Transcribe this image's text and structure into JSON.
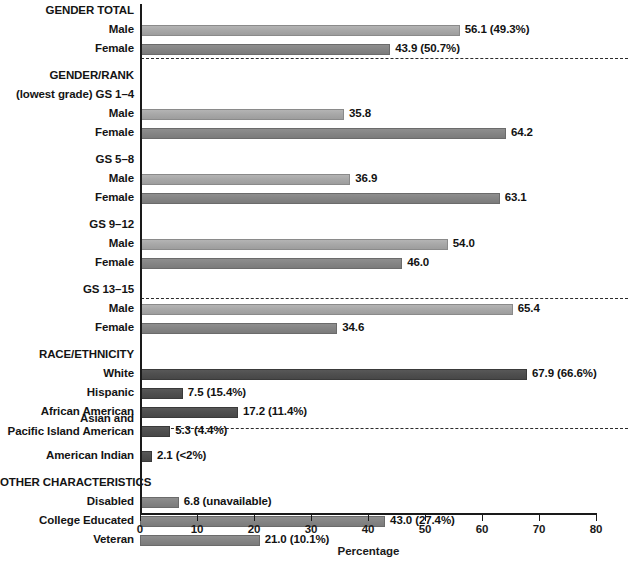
{
  "chart_data": {
    "type": "bar",
    "title": "",
    "xlabel": "Percentage",
    "ylabel": "",
    "xlim": [
      0,
      80
    ],
    "xticks": [
      0,
      10,
      20,
      30,
      40,
      50,
      60,
      70,
      80
    ],
    "grid": false,
    "legend": "none",
    "orientation": "horizontal",
    "sections": [
      {
        "heading": "GENDER TOTAL",
        "rows": [
          {
            "label": "Male",
            "value": 56.1,
            "value_label": "56.1 (49.3%)",
            "shade": "light"
          },
          {
            "label": "Female",
            "value": 43.9,
            "value_label": "43.9 (50.7%)",
            "shade": "mid"
          }
        ]
      },
      {
        "heading": "GENDER/RANK",
        "subheading": "(lowest grade) GS 1–4",
        "rows": [
          {
            "label": "Male",
            "value": 35.8,
            "value_label": "35.8",
            "shade": "light"
          },
          {
            "label": "Female",
            "value": 64.2,
            "value_label": "64.2",
            "shade": "mid"
          }
        ]
      },
      {
        "subheading": "GS 5–8",
        "rows": [
          {
            "label": "Male",
            "value": 36.9,
            "value_label": "36.9",
            "shade": "light"
          },
          {
            "label": "Female",
            "value": 63.1,
            "value_label": "63.1",
            "shade": "mid"
          }
        ]
      },
      {
        "subheading": "GS 9–12",
        "rows": [
          {
            "label": "Male",
            "value": 54.0,
            "value_label": "54.0",
            "shade": "light"
          },
          {
            "label": "Female",
            "value": 46.0,
            "value_label": "46.0",
            "shade": "mid"
          }
        ]
      },
      {
        "subheading": "GS 13–15",
        "rows": [
          {
            "label": "Male",
            "value": 65.4,
            "value_label": "65.4",
            "shade": "light"
          },
          {
            "label": "Female",
            "value": 34.6,
            "value_label": "34.6",
            "shade": "mid"
          }
        ]
      },
      {
        "heading": "RACE/ETHNICITY",
        "rows": [
          {
            "label": "White",
            "value": 67.9,
            "value_label": "67.9 (66.6%)",
            "shade": "dark"
          },
          {
            "label": "Hispanic",
            "value": 7.5,
            "value_label": "7.5 (15.4%)",
            "shade": "dark"
          },
          {
            "label": "African American",
            "value": 17.2,
            "value_label": "17.2 (11.4%)",
            "shade": "dark"
          },
          {
            "label": "Asian and\nPacific Island American",
            "value": 5.3,
            "value_label": "5.3 (4.4%)",
            "shade": "dark"
          },
          {
            "label": "American Indian",
            "value": 2.1,
            "value_label": "2.1 (<2%)",
            "shade": "dark"
          }
        ]
      },
      {
        "heading": "OTHER CHARACTERISTICS",
        "rows": [
          {
            "label": "Disabled",
            "value": 6.8,
            "value_label": "6.8 (unavailable)",
            "shade": "mid"
          },
          {
            "label": "College Educated",
            "value": 43.0,
            "value_label": "43.0 (27.4%)",
            "shade": "mid"
          },
          {
            "label": "Veteran",
            "value": 21.0,
            "value_label": "21.0 (10.1%)",
            "shade": "mid"
          }
        ]
      }
    ]
  },
  "colors": {
    "bar_light": "#a8a8a8",
    "bar_mid": "#858585",
    "bar_dark": "#4f4f4f",
    "axis": "#1a1a1a",
    "text": "#141414",
    "background": "#ffffff"
  },
  "axis": {
    "xlabel": "Percentage",
    "ticks": [
      "0",
      "10",
      "20",
      "30",
      "40",
      "50",
      "60",
      "70",
      "80"
    ]
  },
  "layout": {
    "separators_y": [
      58,
      298,
      428
    ]
  }
}
